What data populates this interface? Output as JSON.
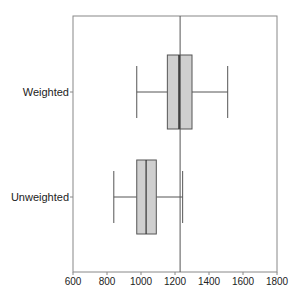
{
  "chart_data": {
    "type": "boxplot",
    "title": "",
    "xlabel": "",
    "ylabel": "",
    "xlim": [
      600,
      1800
    ],
    "xticks": [
      600,
      800,
      1000,
      1200,
      1400,
      1600,
      1800
    ],
    "grid": false,
    "legend": null,
    "reference_line": {
      "orientation": "vertical",
      "x": 1230
    },
    "categories": [
      "Weighted",
      "Unweighted"
    ],
    "series": [
      {
        "name": "Weighted",
        "whisker_low": 975,
        "q1": 1155,
        "median": 1225,
        "q3": 1300,
        "whisker_high": 1510
      },
      {
        "name": "Unweighted",
        "whisker_low": 840,
        "q1": 975,
        "median": 1030,
        "q3": 1090,
        "whisker_high": 1245
      }
    ]
  },
  "colors": {
    "box_fill": "#cfcfcf",
    "box_stroke": "#555555",
    "median": "#333333",
    "axis": "#888888",
    "reference_line": "#555555"
  },
  "caption_partial": "Figure (caption cut off)"
}
